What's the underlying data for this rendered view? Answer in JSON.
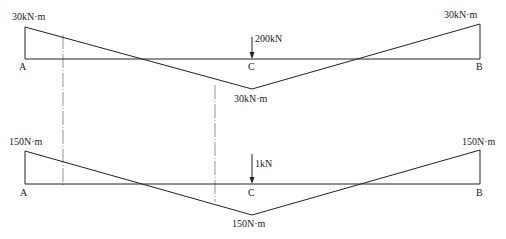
{
  "diagram_top": {
    "left_moment": "30kN·m",
    "right_moment": "30kN·m",
    "mid_moment": "30kN·m",
    "load": "200kN",
    "point_a": "A",
    "point_b": "B",
    "point_c": "C"
  },
  "diagram_bottom": {
    "left_moment": "150N·m",
    "right_moment": "150N·m",
    "mid_moment": "150N·m",
    "load": "1kN",
    "point_a": "A",
    "point_b": "B",
    "point_c": "C"
  }
}
